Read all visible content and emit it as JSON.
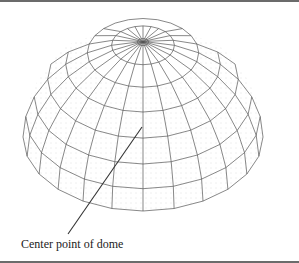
{
  "figure": {
    "annotation": {
      "label": "Center point of dome",
      "leader_from": [
        142,
        125
      ],
      "leader_to": [
        68,
        232
      ]
    },
    "dome": {
      "center_x": 143,
      "base_center_y": 135,
      "radius_x": 120,
      "apex_y": 40,
      "front_bottom_y": 209,
      "meridians": 24,
      "latitude_rings": 7,
      "shading": "stippled"
    },
    "colors": {
      "line": "#555555",
      "leader": "#333333",
      "border": "#6b6b6b",
      "stipple": "#bdbdbd",
      "background": "#ffffff"
    }
  }
}
